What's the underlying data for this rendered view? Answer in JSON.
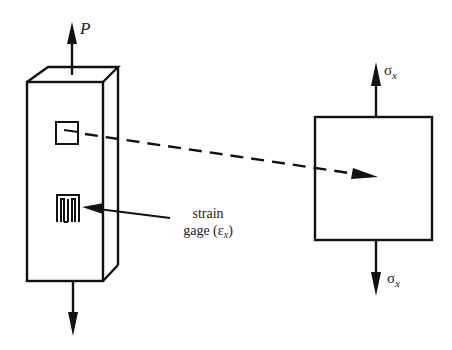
{
  "diagram": {
    "type": "strain-gage-uniaxial-stress",
    "bar": {
      "load_label": "P",
      "callout": {
        "line1": "strain",
        "line2_prefix": "gage (",
        "symbol": "ε",
        "subscript": "x",
        "line2_suffix": ")"
      }
    },
    "element": {
      "top_stress": {
        "symbol": "σ",
        "subscript": "x"
      },
      "bottom_stress": {
        "symbol": "σ",
        "subscript": "x"
      }
    },
    "colors": {
      "stroke": "#111111",
      "background": "#ffffff",
      "text": "#222222"
    }
  }
}
